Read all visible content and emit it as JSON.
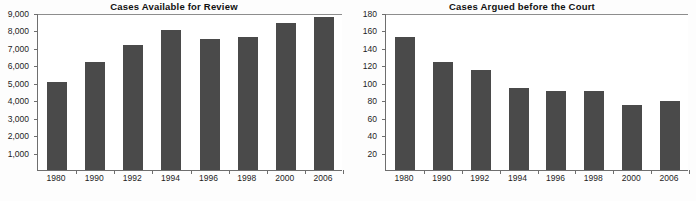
{
  "page": {
    "caption": ""
  },
  "chart_data": [
    {
      "type": "bar",
      "title": "Cases Available for Review",
      "xlabel": "",
      "ylabel": "",
      "categories": [
        "1980",
        "1990",
        "1992",
        "1994",
        "1996",
        "1998",
        "2000",
        "2006"
      ],
      "values": [
        5100,
        6300,
        7250,
        8150,
        7600,
        7750,
        8550,
        8900
      ],
      "ylim": [
        0,
        9000
      ],
      "yticks": [
        1000,
        2000,
        3000,
        4000,
        5000,
        6000,
        7000,
        8000,
        9000
      ],
      "ytick_labels": [
        "1,000",
        "2,000",
        "3,000",
        "4,000",
        "5,000",
        "6,000",
        "7,000",
        "8,000",
        "9,000"
      ],
      "grid": false,
      "legend": "none",
      "bar_color": "#4a4a4a",
      "axis_color": "#6e6e6e"
    },
    {
      "type": "bar",
      "title": "Cases Argued before the Court",
      "xlabel": "",
      "ylabel": "",
      "categories": [
        "1980",
        "1990",
        "1992",
        "1994",
        "1996",
        "1998",
        "2000",
        "2006"
      ],
      "values": [
        154,
        125,
        116,
        95,
        92,
        92,
        75,
        80
      ],
      "ylim": [
        0,
        180
      ],
      "yticks": [
        20,
        40,
        60,
        80,
        100,
        120,
        140,
        160,
        180
      ],
      "ytick_labels": [
        "20",
        "40",
        "60",
        "80",
        "100",
        "120",
        "140",
        "160",
        "180"
      ],
      "grid": false,
      "legend": "none",
      "bar_color": "#4a4a4a",
      "axis_color": "#6e6e6e"
    }
  ]
}
